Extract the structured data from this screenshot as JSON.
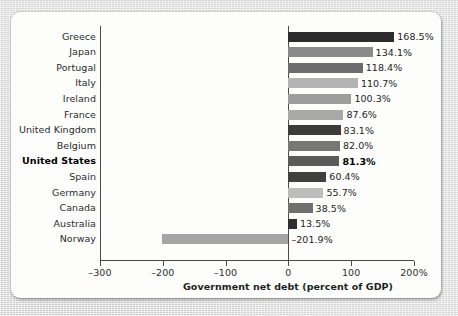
{
  "chart_data": {
    "type": "bar",
    "orientation": "horizontal",
    "title": "",
    "xlabel": "Government net debt (percent of GDP)",
    "ylabel": "",
    "xlim": [
      -300,
      200
    ],
    "xticks": [
      -300,
      -200,
      -100,
      0,
      100,
      200
    ],
    "xtick_labels": [
      "–300",
      "–200",
      "–100",
      "0",
      "100",
      "200%"
    ],
    "grid": false,
    "legend": null,
    "highlight_category": "United States",
    "categories": [
      "Greece",
      "Japan",
      "Portugal",
      "Italy",
      "Ireland",
      "France",
      "United Kingdom",
      "Belgium",
      "United States",
      "Spain",
      "Germany",
      "Canada",
      "Australia",
      "Norway"
    ],
    "values": [
      168.5,
      134.1,
      118.4,
      110.7,
      100.3,
      87.6,
      83.1,
      82.0,
      81.3,
      60.4,
      55.7,
      38.5,
      13.5,
      -201.9
    ],
    "value_labels": [
      "168.5%",
      "134.1%",
      "118.4%",
      "110.7%",
      "100.3%",
      "87.6%",
      "83.1%",
      "82.0%",
      "81.3%",
      "60.4%",
      "55.7%",
      "38.5%",
      "13.5%",
      "–201.9%"
    ],
    "bar_colors": [
      "#2b2b2b",
      "#8a8a8a",
      "#6d6d6d",
      "#b4b4b4",
      "#9d9d9d",
      "#a8a8a8",
      "#3c3c3c",
      "#777777",
      "#5a5a5a",
      "#404040",
      "#bdbdbd",
      "#707070",
      "#2f2f2f",
      "#a5a5a5"
    ]
  },
  "colors": {
    "card_background": "#fdfdfc",
    "page_background": "#e3e3e3",
    "axis": "#4a4a4a",
    "text": "#2b2b2b"
  }
}
